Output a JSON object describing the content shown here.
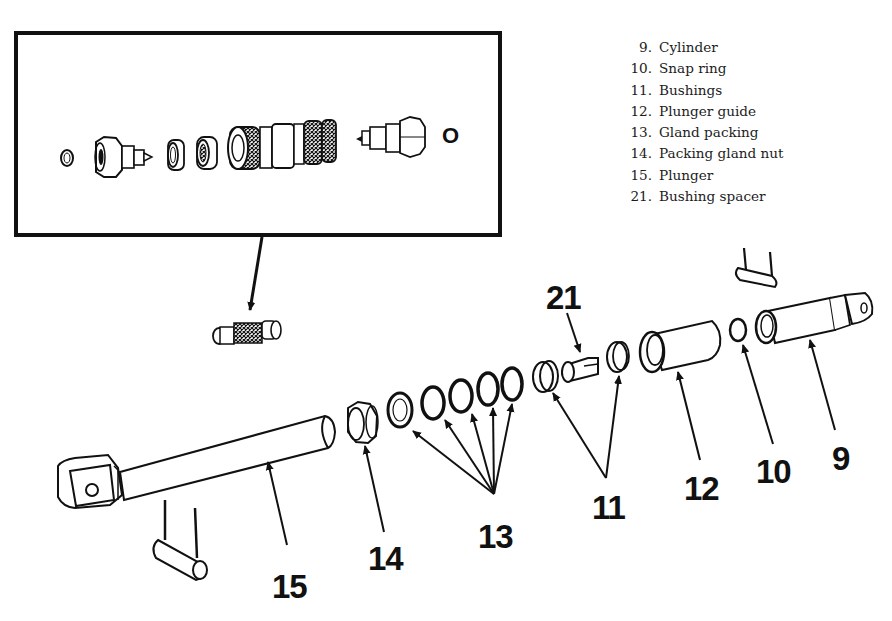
{
  "legend": {
    "items": [
      {
        "num": "9.",
        "label": "Cylinder"
      },
      {
        "num": "10.",
        "label": "Snap ring"
      },
      {
        "num": "11.",
        "label": "Bushings"
      },
      {
        "num": "12.",
        "label": "Plunger guide"
      },
      {
        "num": "13.",
        "label": "Gland packing"
      },
      {
        "num": "14.",
        "label": "Packing gland nut"
      },
      {
        "num": "15.",
        "label": "Plunger"
      },
      {
        "num": "21.",
        "label": "Bushing spacer"
      }
    ]
  },
  "inset": {
    "tag": "O"
  },
  "callouts": {
    "c9": "9",
    "c10": "10",
    "c11": "11",
    "c12": "12",
    "c13": "13",
    "c14": "14",
    "c15": "15",
    "c21": "21"
  },
  "colors": {
    "ink": "#111111",
    "paper": "#ffffff"
  }
}
